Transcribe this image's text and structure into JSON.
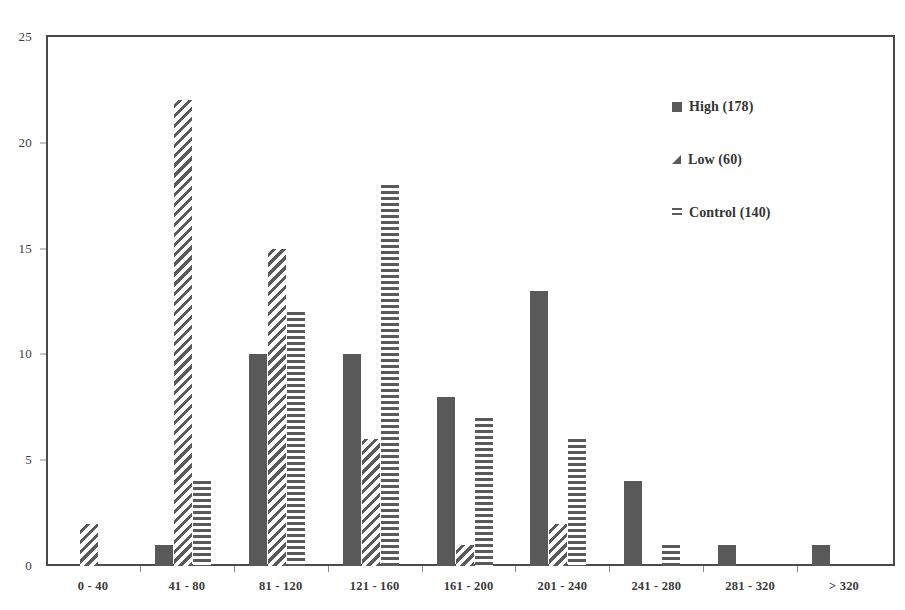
{
  "chart_data": {
    "type": "bar",
    "title": "",
    "subtitle": "",
    "xlabel": "",
    "ylabel": "",
    "grid": false,
    "legend_position": "inside-top-right",
    "ylim": [
      0,
      25
    ],
    "yticks": [
      0,
      5,
      10,
      15,
      20,
      25
    ],
    "categories": [
      "0 - 40",
      "41 - 80",
      "81 - 120",
      "121 - 160",
      "161 - 200",
      "201 - 240",
      "241 - 280",
      "281 - 320",
      "> 320"
    ],
    "series": [
      {
        "name": "High (178)",
        "key": "high",
        "fill": "solid-dark",
        "values": [
          0,
          1,
          10,
          10,
          8,
          13,
          4,
          1,
          1
        ]
      },
      {
        "name": "Low (60)",
        "key": "low",
        "fill": "diagonal-hatch",
        "values": [
          2,
          22,
          15,
          6,
          1,
          2,
          0,
          0,
          0
        ]
      },
      {
        "name": "Control (140)",
        "key": "control",
        "fill": "horizontal-hatch",
        "values": [
          0,
          4,
          12,
          18,
          7,
          6,
          1,
          0,
          0
        ]
      }
    ]
  },
  "legend": {
    "items": [
      {
        "label": "High (178)",
        "swatch": "solid-square-icon"
      },
      {
        "label": "Low (60)",
        "swatch": "hatched-triangle-icon"
      },
      {
        "label": "Control (140)",
        "swatch": "horizontal-lines-icon"
      }
    ]
  },
  "colors": {
    "bar_dark": "#595959",
    "axis": "#4a4a4a",
    "text": "#3d3d3d",
    "background": "#ffffff"
  }
}
